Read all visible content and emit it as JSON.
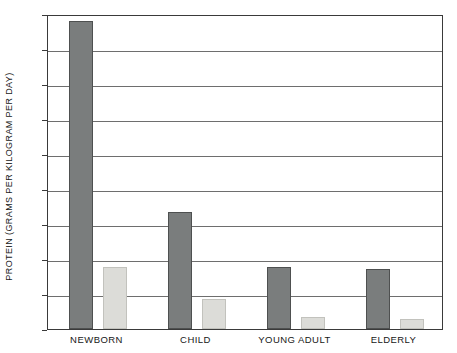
{
  "chart_data": {
    "type": "bar",
    "title": "",
    "xlabel": "",
    "ylabel": "PROTEIN (GRAMS PER KILOGRAM PER DAY)",
    "categories": [
      "NEWBORN",
      "CHILD",
      "YOUNG ADULT",
      "ELDERLY"
    ],
    "series": [
      {
        "name": "series-1",
        "color": "#7a7d7d",
        "values": [
          17.6,
          6.7,
          3.55,
          3.45
        ]
      },
      {
        "name": "series-2",
        "color": "#dcdcd8",
        "values": [
          3.55,
          1.7,
          0.7,
          0.55
        ]
      }
    ],
    "ylim": [
      0,
      18
    ],
    "ytick_step": 2,
    "ytick_labels": [
      "0",
      "2",
      "4",
      "6",
      "8",
      "10",
      "12",
      "14",
      "16",
      "18"
    ],
    "grid": true,
    "legend": false,
    "legend_position": "none"
  },
  "axis": {
    "frame_color": "#3a3a3a",
    "gridline_color": "#6e6e6e",
    "background": "#ffffff"
  }
}
